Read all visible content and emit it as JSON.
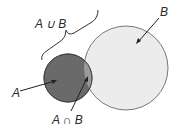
{
  "diagram": {
    "type": "venn",
    "labels": {
      "union": "A ∪ B",
      "intersection": "A ∩ B",
      "a": "A",
      "b": "B"
    },
    "colors": {
      "a_fill": "#6a6a6a",
      "b_fill": "#ececec",
      "intersection_fill": "#9a9a9a",
      "stroke": "#555555"
    }
  }
}
